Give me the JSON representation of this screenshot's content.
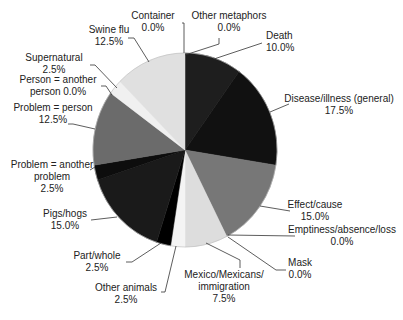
{
  "chart_data": {
    "type": "pie",
    "title": "",
    "start_angle_deg": 0,
    "direction": "clockwise",
    "slices": [
      {
        "label": "Container",
        "value": 0.0,
        "display": "0.0%",
        "color": "#e8e8e8"
      },
      {
        "label": "Other metaphors",
        "value": 0.0,
        "display": "0.0%",
        "color": "#cccccc"
      },
      {
        "label": "Death",
        "value": 10.0,
        "display": "10.0%",
        "color": "#1e1e1e"
      },
      {
        "label": "Disease/illness (general)",
        "value": 17.5,
        "display": "17.5%",
        "color": "#111111"
      },
      {
        "label": "Effect/cause",
        "value": 15.0,
        "display": "15.0%",
        "color": "#777777"
      },
      {
        "label": "Emptiness/absence/loss",
        "value": 0.0,
        "display": "0.0%",
        "color": "#999999"
      },
      {
        "label": "Mask",
        "value": 0.0,
        "display": "0.0%",
        "color": "#aaaaaa"
      },
      {
        "label": "Mexico/Mexicans/ immigration",
        "value": 7.5,
        "display": "7.5%",
        "color": "#dddddd"
      },
      {
        "label": "Other animals",
        "value": 2.5,
        "display": "2.5%",
        "color": "#f4f4f4"
      },
      {
        "label": "Part/whole",
        "value": 2.5,
        "display": "2.5%",
        "color": "#000000"
      },
      {
        "label": "Pigs/hogs",
        "value": 15.0,
        "display": "15.0%",
        "color": "#1a1a1a"
      },
      {
        "label": "Problem = another problem",
        "value": 2.5,
        "display": "2.5%",
        "color": "#0d0d0d"
      },
      {
        "label": "Problem = person",
        "value": 12.5,
        "display": "12.5%",
        "color": "#6b6b6b"
      },
      {
        "label": "Person = another person",
        "value": 0.0,
        "display": "0.0%",
        "color": "#888888"
      },
      {
        "label": "Supernatural",
        "value": 2.5,
        "display": "2.5%",
        "color": "#f0f0f0"
      },
      {
        "label": "Swine flu",
        "value": 12.5,
        "display": "12.5%",
        "color": "#e0e0e0"
      }
    ],
    "legend": "none (leader-line labels)"
  },
  "labels": [
    {
      "lines": [
        "Container",
        "0.0%"
      ],
      "x": 153,
      "y": 23,
      "anchor": "middle",
      "leader": [
        [
          182,
          23
        ],
        [
          184,
          23
        ],
        [
          184,
          53
        ]
      ]
    },
    {
      "lines": [
        "Other metaphors",
        "0.0%"
      ],
      "x": 229,
      "y": 23,
      "anchor": "middle",
      "leader": [
        [
          219,
          38
        ],
        [
          219,
          44
        ],
        [
          185,
          55
        ]
      ]
    },
    {
      "lines": [
        "Death",
        "10.0%"
      ],
      "x": 266,
      "y": 43,
      "anchor": "start",
      "leader": [
        [
          262,
          43
        ],
        [
          214,
          59
        ]
      ]
    },
    {
      "lines": [
        "Disease/illness (general)",
        "17.5%"
      ],
      "x": 339,
      "y": 106,
      "anchor": "middle",
      "leader": [
        [
          289,
          104
        ],
        [
          270,
          112
        ]
      ]
    },
    {
      "lines": [
        "Effect/cause",
        "15.0%"
      ],
      "x": 315,
      "y": 212,
      "anchor": "middle",
      "leader": [
        [
          290,
          211
        ],
        [
          260,
          206
        ]
      ]
    },
    {
      "lines": [
        "Emptiness/absence/loss",
        "0.0%"
      ],
      "x": 342,
      "y": 237,
      "anchor": "middle",
      "leader": [
        [
          295,
          236
        ],
        [
          228,
          235
        ]
      ]
    },
    {
      "lines": [
        "Mask",
        "0.0%"
      ],
      "x": 300,
      "y": 270,
      "anchor": "middle",
      "leader": [
        [
          286,
          270
        ],
        [
          276,
          270
        ],
        [
          228,
          237
        ]
      ]
    },
    {
      "lines": [
        "Mexico/Mexicans/",
        "immigration",
        "7.5%"
      ],
      "x": 224,
      "y": 282,
      "anchor": "middle",
      "leader": [
        [
          240,
          268
        ],
        [
          240,
          260
        ],
        [
          206,
          243
        ]
      ]
    },
    {
      "lines": [
        "Other animals",
        "2.5%"
      ],
      "x": 126,
      "y": 295,
      "anchor": "middle",
      "leader": [
        [
          161,
          292
        ],
        [
          165,
          292
        ],
        [
          176,
          246
        ]
      ]
    },
    {
      "lines": [
        "Part/whole",
        "2.5%"
      ],
      "x": 97,
      "y": 263,
      "anchor": "middle",
      "leader": [
        [
          126,
          262
        ],
        [
          132,
          262
        ],
        [
          161,
          243
        ]
      ]
    },
    {
      "lines": [
        "Pigs/hogs",
        "15.0%"
      ],
      "x": 65,
      "y": 221,
      "anchor": "middle",
      "leader": [
        [
          91,
          220
        ],
        [
          117,
          217
        ]
      ]
    },
    {
      "lines": [
        "Problem = another",
        "problem",
        "2.5%"
      ],
      "x": 52,
      "y": 172,
      "anchor": "middle",
      "leader": [
        [
          90,
          170
        ],
        [
          95,
          167
        ]
      ]
    },
    {
      "lines": [
        "Problem = person",
        "12.5%"
      ],
      "x": 53,
      "y": 115,
      "anchor": "middle",
      "leader": [
        [
          68,
          124
        ],
        [
          73,
          124
        ],
        [
          95,
          129
        ]
      ]
    },
    {
      "lines": [
        "Person = another",
        "person 0.0%"
      ],
      "x": 58,
      "y": 87,
      "anchor": "middle",
      "leader": [
        [
          101,
          86
        ],
        [
          106,
          86
        ],
        [
          112,
          95
        ]
      ]
    },
    {
      "lines": [
        "Supernatural",
        "2.5%"
      ],
      "x": 54,
      "y": 65,
      "anchor": "middle",
      "leader": [
        [
          90,
          65
        ],
        [
          95,
          65
        ],
        [
          117,
          88
        ]
      ]
    },
    {
      "lines": [
        "Swine flu",
        "12.5%"
      ],
      "x": 109,
      "y": 37,
      "anchor": "middle",
      "leader": [
        [
          128,
          38
        ],
        [
          134,
          38
        ],
        [
          149,
          62
        ]
      ]
    }
  ],
  "geometry": {
    "cx": 185,
    "cy": 150,
    "rx": 92,
    "ry": 97
  }
}
